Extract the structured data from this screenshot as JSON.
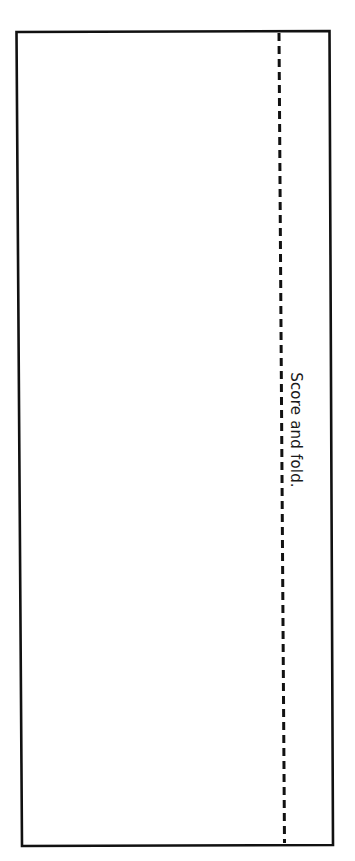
{
  "template": {
    "fold_instruction": "Score and fold.",
    "line_color": "#111111",
    "border": {
      "style": "solid"
    },
    "fold_line": {
      "style": "dashed"
    }
  }
}
